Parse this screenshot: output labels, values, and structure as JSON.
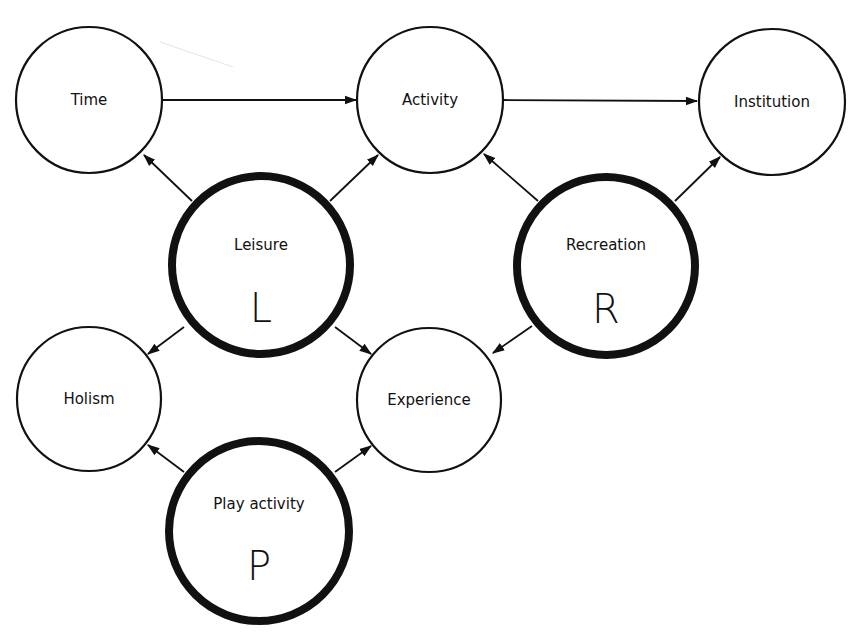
{
  "diagram": {
    "nodes": [
      {
        "id": "time",
        "label": "Time",
        "letter": "",
        "emphasis": false
      },
      {
        "id": "activity",
        "label": "Activity",
        "letter": "",
        "emphasis": false
      },
      {
        "id": "institution",
        "label": "Institution",
        "letter": "",
        "emphasis": false
      },
      {
        "id": "leisure",
        "label": "Leisure",
        "letter": "L",
        "emphasis": true
      },
      {
        "id": "recreation",
        "label": "Recreation",
        "letter": "R",
        "emphasis": true
      },
      {
        "id": "holism",
        "label": "Holism",
        "letter": "",
        "emphasis": false
      },
      {
        "id": "experience",
        "label": "Experience",
        "letter": "",
        "emphasis": false
      },
      {
        "id": "play",
        "label": "Play activity",
        "letter": "P",
        "emphasis": true
      }
    ],
    "edges": [
      {
        "from": "time",
        "to": "activity"
      },
      {
        "from": "activity",
        "to": "institution"
      },
      {
        "from": "leisure",
        "to": "time"
      },
      {
        "from": "leisure",
        "to": "activity"
      },
      {
        "from": "recreation",
        "to": "activity"
      },
      {
        "from": "recreation",
        "to": "institution"
      },
      {
        "from": "leisure",
        "to": "holism"
      },
      {
        "from": "leisure",
        "to": "experience"
      },
      {
        "from": "recreation",
        "to": "experience"
      },
      {
        "from": "play",
        "to": "holism"
      },
      {
        "from": "play",
        "to": "experience"
      }
    ]
  }
}
